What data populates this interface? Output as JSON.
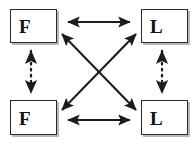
{
  "diagram": {
    "background_color": "#ffffff",
    "stroke_color": "#1c1c1c",
    "box_border_color": "#2b2b2b",
    "box_shadow_color": "#b9b9b9",
    "nodes": [
      {
        "id": "top-left",
        "label": "F",
        "position": "top-left"
      },
      {
        "id": "top-right",
        "label": "L",
        "position": "top-right"
      },
      {
        "id": "bottom-left",
        "label": "F",
        "position": "bottom-left"
      },
      {
        "id": "bottom-right",
        "label": "L",
        "position": "bottom-right"
      }
    ],
    "connectors": [
      {
        "id": "top-horizontal",
        "from": "top-left",
        "to": "top-right",
        "style": "solid",
        "arrowheads": "both",
        "orientation": "horizontal"
      },
      {
        "id": "bottom-horizontal",
        "from": "bottom-left",
        "to": "bottom-right",
        "style": "solid",
        "arrowheads": "both",
        "orientation": "horizontal"
      },
      {
        "id": "left-vertical",
        "from": "top-left",
        "to": "bottom-left",
        "style": "dotted",
        "arrowheads": "both",
        "orientation": "vertical"
      },
      {
        "id": "right-vertical",
        "from": "top-right",
        "to": "bottom-right",
        "style": "dotted",
        "arrowheads": "both",
        "orientation": "vertical"
      },
      {
        "id": "diagonal-tl-br",
        "from": "top-left",
        "to": "bottom-right",
        "style": "solid",
        "arrowheads": "both",
        "orientation": "diagonal"
      },
      {
        "id": "diagonal-bl-tr",
        "from": "bottom-left",
        "to": "top-right",
        "style": "solid",
        "arrowheads": "both",
        "orientation": "diagonal"
      }
    ]
  }
}
